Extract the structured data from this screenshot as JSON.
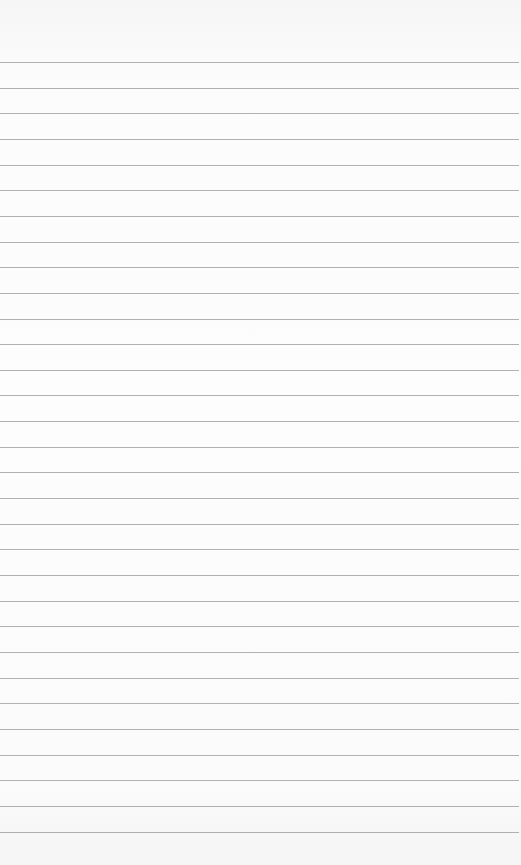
{
  "paper": {
    "type": "ruled-paper",
    "background_color": "#fbfbfb",
    "line_color": "#a3a3a3",
    "line_count": 31,
    "first_line_y": 62,
    "line_spacing": 25.65,
    "line_width": 519,
    "text": ""
  }
}
